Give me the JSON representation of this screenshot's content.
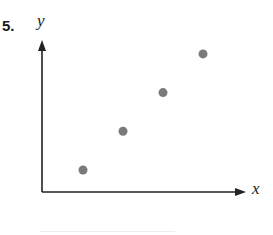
{
  "problem": {
    "number": "5."
  },
  "chart_data": {
    "type": "scatter",
    "title": "",
    "xlabel": "x",
    "ylabel": "y",
    "x": [
      1,
      2,
      3,
      4
    ],
    "y": [
      1,
      2,
      3,
      4
    ],
    "series": [
      {
        "name": "points",
        "x": [
          1,
          2,
          3,
          4
        ],
        "y": [
          1,
          2,
          3,
          4
        ]
      }
    ],
    "grid": false,
    "legend": null,
    "ticks": "none",
    "trend": "positive linear",
    "point_color": "#7a7a7a",
    "axis_color": "#222222"
  }
}
